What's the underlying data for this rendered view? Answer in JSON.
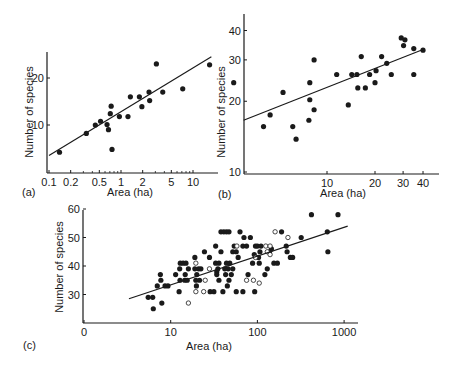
{
  "chart_data": [
    {
      "panel": "(a)",
      "type": "scatter",
      "xlabel": "Area (ha)",
      "ylabel": "Number of species",
      "xscale": "log",
      "yscale": "linear",
      "xticks": [
        0.1,
        0.2,
        0.5,
        1,
        2,
        5,
        10
      ],
      "xtick_labels": [
        "0.1",
        "0.2",
        "0.5",
        "1",
        "2",
        "5",
        "10"
      ],
      "yticks": [
        10,
        20
      ],
      "ytick_labels": [
        "10",
        "20"
      ],
      "xlim": [
        0.1,
        18
      ],
      "ylim": [
        0,
        26
      ],
      "grid": false,
      "points": [
        {
          "x": 0.14,
          "y": 4.2
        },
        {
          "x": 0.33,
          "y": 8.2
        },
        {
          "x": 0.44,
          "y": 10
        },
        {
          "x": 0.52,
          "y": 10.8
        },
        {
          "x": 0.64,
          "y": 10.1
        },
        {
          "x": 0.67,
          "y": 9
        },
        {
          "x": 0.71,
          "y": 12.4
        },
        {
          "x": 0.73,
          "y": 14
        },
        {
          "x": 0.75,
          "y": 4.8
        },
        {
          "x": 0.95,
          "y": 11.8
        },
        {
          "x": 1.25,
          "y": 11.8
        },
        {
          "x": 1.35,
          "y": 16
        },
        {
          "x": 1.8,
          "y": 16
        },
        {
          "x": 1.95,
          "y": 13.9
        },
        {
          "x": 2.45,
          "y": 17
        },
        {
          "x": 2.5,
          "y": 15.2
        },
        {
          "x": 3.1,
          "y": 23
        },
        {
          "x": 3.8,
          "y": 17
        },
        {
          "x": 7.2,
          "y": 17.7
        },
        {
          "x": 17,
          "y": 22.8
        }
      ],
      "fit_line": {
        "x": [
          0.1,
          18
        ],
        "y": [
          3.5,
          24.5
        ]
      }
    },
    {
      "panel": "(b)",
      "type": "scatter",
      "xlabel": "Area (ha)",
      "ylabel": "Number of species",
      "xscale": "log",
      "yscale": "log",
      "xticks": [
        10,
        20,
        30,
        40
      ],
      "xtick_labels": [
        "10",
        "20",
        "30",
        "40"
      ],
      "yticks": [
        10,
        20,
        30,
        40
      ],
      "ytick_labels": [
        "10",
        "20",
        "30",
        "40"
      ],
      "xlim": [
        2.5,
        50
      ],
      "ylim": [
        10,
        45
      ],
      "grid": false,
      "points": [
        {
          "x": 2.6,
          "y": 24
        },
        {
          "x": 4,
          "y": 15.6
        },
        {
          "x": 4.4,
          "y": 17.5
        },
        {
          "x": 5.3,
          "y": 21.8
        },
        {
          "x": 6.1,
          "y": 15.6
        },
        {
          "x": 6.4,
          "y": 13.8
        },
        {
          "x": 7.7,
          "y": 16.6
        },
        {
          "x": 7.8,
          "y": 24
        },
        {
          "x": 7.8,
          "y": 20.3
        },
        {
          "x": 8.3,
          "y": 30
        },
        {
          "x": 8.3,
          "y": 18.4
        },
        {
          "x": 11.5,
          "y": 26
        },
        {
          "x": 13.6,
          "y": 19.3
        },
        {
          "x": 14.3,
          "y": 26
        },
        {
          "x": 15.4,
          "y": 26
        },
        {
          "x": 15.6,
          "y": 22.8
        },
        {
          "x": 16.4,
          "y": 31
        },
        {
          "x": 17.4,
          "y": 22.8
        },
        {
          "x": 18.5,
          "y": 26
        },
        {
          "x": 20,
          "y": 24
        },
        {
          "x": 20.3,
          "y": 27
        },
        {
          "x": 22,
          "y": 31
        },
        {
          "x": 23.7,
          "y": 29
        },
        {
          "x": 25.3,
          "y": 26
        },
        {
          "x": 29.2,
          "y": 37.2
        },
        {
          "x": 30.2,
          "y": 34.5
        },
        {
          "x": 30.8,
          "y": 36.5
        },
        {
          "x": 35,
          "y": 33.5
        },
        {
          "x": 35,
          "y": 26
        },
        {
          "x": 40,
          "y": 33
        }
      ],
      "fit_line": {
        "x": [
          3,
          40
        ],
        "y": [
          16.6,
          33.2
        ]
      }
    },
    {
      "panel": "(c)",
      "type": "scatter",
      "xlabel": "Area (ha)",
      "ylabel": "Number of species",
      "xscale": "log",
      "yscale": "linear",
      "xticks": [
        1,
        10,
        100,
        1000
      ],
      "xtick_labels": [
        "0",
        "10",
        "100",
        "1000"
      ],
      "yticks": [
        30,
        40,
        50,
        60
      ],
      "ytick_labels": [
        "30",
        "40",
        "50",
        "60"
      ],
      "xlim": [
        1,
        1500
      ],
      "ylim": [
        20,
        60
      ],
      "grid": false,
      "legend": "filled circles and open circles (two site groups, unlabeled)",
      "series": [
        {
          "name": "filled",
          "marker": "filled-circle",
          "points": [
            [
              5.5,
              29
            ],
            [
              6.2,
              29
            ],
            [
              6.3,
              25
            ],
            [
              7,
              33
            ],
            [
              7.6,
              37
            ],
            [
              7.7,
              35
            ],
            [
              7.9,
              27
            ],
            [
              8.6,
              33
            ],
            [
              9.3,
              33
            ],
            [
              11.4,
              37
            ],
            [
              12.5,
              31
            ],
            [
              12.7,
              39
            ],
            [
              12.8,
              35
            ],
            [
              12.9,
              41
            ],
            [
              13.9,
              41
            ],
            [
              14.5,
              35
            ],
            [
              14.7,
              37
            ],
            [
              15,
              41
            ],
            [
              15.5,
              35
            ],
            [
              16,
              39
            ],
            [
              19,
              43
            ],
            [
              19,
              39
            ],
            [
              19.5,
              35
            ],
            [
              19.8,
              33
            ],
            [
              20,
              37
            ],
            [
              21,
              39
            ],
            [
              21.5,
              35
            ],
            [
              22.3,
              39
            ],
            [
              24.5,
              45
            ],
            [
              28,
              43
            ],
            [
              28.5,
              31
            ],
            [
              31.5,
              31
            ],
            [
              33,
              47
            ],
            [
              33,
              41
            ],
            [
              34,
              38
            ],
            [
              34,
              37
            ],
            [
              35,
              39
            ],
            [
              36,
              35
            ],
            [
              36,
              41
            ],
            [
              38,
              45
            ],
            [
              40,
              31
            ],
            [
              38,
              52
            ],
            [
              41,
              52
            ],
            [
              44,
              52
            ],
            [
              47,
              52
            ],
            [
              42,
              39
            ],
            [
              43,
              37
            ],
            [
              44,
              41
            ],
            [
              45,
              33
            ],
            [
              46,
              39
            ],
            [
              47,
              35
            ],
            [
              48,
              41
            ],
            [
              50,
              37
            ],
            [
              52,
              39
            ],
            [
              52,
              45
            ],
            [
              54,
              47
            ],
            [
              57,
              45
            ],
            [
              57,
              31
            ],
            [
              60,
              43
            ],
            [
              63,
              52
            ],
            [
              68,
              31
            ],
            [
              68,
              47
            ],
            [
              70,
              50
            ],
            [
              75,
              47
            ],
            [
              78,
              37
            ],
            [
              83,
              50
            ],
            [
              88,
              41
            ],
            [
              92,
              44
            ],
            [
              93,
              31
            ],
            [
              95,
              47
            ],
            [
              100,
              47
            ],
            [
              103,
              43
            ],
            [
              105,
              41
            ],
            [
              107,
              45
            ],
            [
              110,
              47
            ],
            [
              122,
              37
            ],
            [
              130,
              39
            ],
            [
              138,
              45
            ],
            [
              145,
              46
            ],
            [
              155,
              41
            ],
            [
              170,
              41
            ],
            [
              190,
              52
            ],
            [
              215,
              47
            ],
            [
              220,
              45
            ],
            [
              240,
              43
            ],
            [
              255,
              43
            ],
            [
              320,
              50
            ],
            [
              420,
              58
            ],
            [
              640,
              52
            ],
            [
              650,
              45
            ],
            [
              850,
              58
            ]
          ]
        },
        {
          "name": "open",
          "marker": "open-circle",
          "points": [
            [
              16,
              27
            ],
            [
              19.5,
              41
            ],
            [
              19.5,
              31
            ],
            [
              24,
              31
            ],
            [
              25,
              35
            ],
            [
              28,
              39
            ],
            [
              58,
              47
            ],
            [
              75,
              35
            ],
            [
              90,
              35
            ],
            [
              95,
              43
            ],
            [
              105,
              34
            ],
            [
              125,
              47
            ],
            [
              130,
              45
            ],
            [
              140,
              47
            ],
            [
              140,
              44
            ],
            [
              160,
              52
            ],
            [
              225,
              50
            ]
          ]
        }
      ],
      "fit_line": {
        "x": [
          3.3,
          1100
        ],
        "y": [
          28.5,
          54
        ]
      }
    }
  ],
  "panels": {
    "a": {
      "label": "(a)",
      "xlabel": "Area (ha)",
      "ylabel": "Number of species"
    },
    "b": {
      "label": "(b)",
      "xlabel": "Area (ha)",
      "ylabel": "Number of species"
    },
    "c": {
      "label": "(c)",
      "xlabel": "Area (ha)",
      "ylabel": "Number of species"
    }
  },
  "colors": {
    "ink": "#1a1a1a",
    "background": "#ffffff"
  }
}
